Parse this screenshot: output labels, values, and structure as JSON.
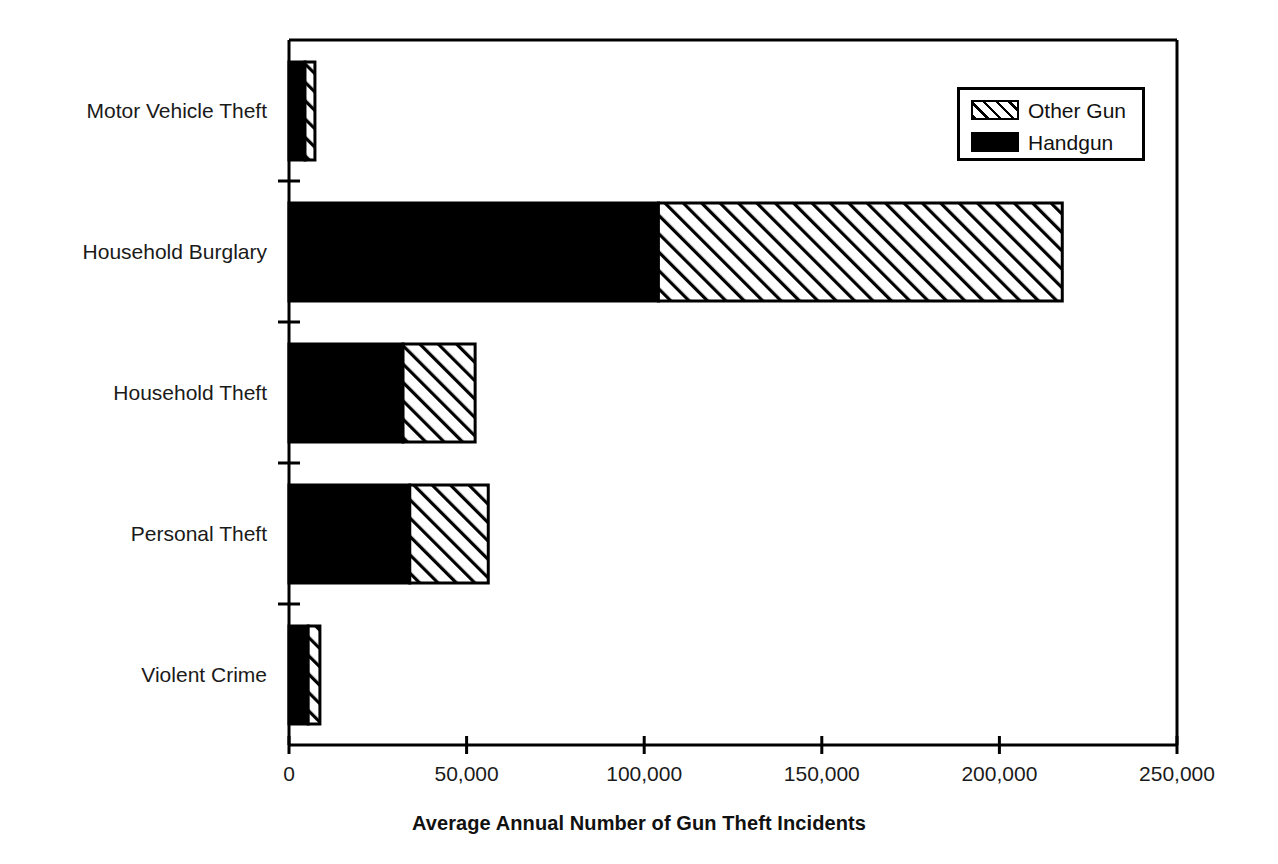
{
  "chart_data": {
    "type": "bar",
    "orientation": "horizontal",
    "stacked": true,
    "title": "",
    "xlabel": "Average Annual Number of Gun Theft Incidents",
    "ylabel": "",
    "categories": [
      "Motor Vehicle Theft",
      "Household Burglary",
      "Household Theft",
      "Personal Theft",
      "Violent Crime"
    ],
    "series": [
      {
        "name": "Handgun",
        "fill": "solid-black",
        "color": "#000000",
        "values": [
          4500,
          104000,
          32100,
          34000,
          5400
        ]
      },
      {
        "name": "Other Gun",
        "fill": "diagonal-hatch",
        "color": "#ffffff",
        "values": [
          2800,
          113700,
          20300,
          22100,
          3300
        ]
      }
    ],
    "totals": [
      7300,
      217700,
      52400,
      56100,
      8700
    ],
    "xlim": [
      0,
      250000
    ],
    "xticks": [
      0,
      50000,
      100000,
      150000,
      200000,
      250000
    ],
    "xtick_labels": [
      "0",
      "50,000",
      "100,000",
      "150,000",
      "200,000",
      "250,000"
    ],
    "grid": false,
    "legend": {
      "position": "top-right",
      "entries": [
        "Other Gun",
        "Handgun"
      ]
    },
    "axis_color": "#000000",
    "background": "#ffffff"
  }
}
